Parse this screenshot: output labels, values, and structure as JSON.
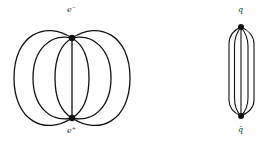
{
  "diagrams": [
    {
      "name": "electron-positron field lines",
      "top_label": "e⁻",
      "bottom_label": "e⁺",
      "description": "Field lines spreading out between e- and e+ charges (dipole pattern)"
    },
    {
      "name": "quark-antiquark flux tube",
      "top_label": "q",
      "bottom_label": "q̄",
      "description": "Field lines confined in a narrow tube between q and q-bar"
    }
  ],
  "colors": {
    "line": "#111111",
    "background": "#ffffff"
  }
}
